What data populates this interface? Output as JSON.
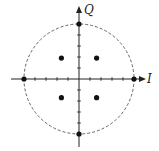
{
  "diagram": {
    "type": "constellation",
    "axes": {
      "x_label": "I",
      "y_label": "Q"
    },
    "center_px": [
      79,
      79
    ],
    "unit_px": 11,
    "ticks_per_side": 5,
    "circle_radius_units": 5,
    "points": [
      {
        "i": -5,
        "q": 0
      },
      {
        "i": 5,
        "q": 0
      },
      {
        "i": 0,
        "q": 5
      },
      {
        "i": 0,
        "q": -5
      },
      {
        "i": -1.6,
        "q": 1.9
      },
      {
        "i": 1.6,
        "q": 1.9
      },
      {
        "i": -1.6,
        "q": -1.7
      },
      {
        "i": 1.6,
        "q": -1.7
      }
    ],
    "colors": {
      "axis": "#222222",
      "circle": "#555555",
      "point": "#111111"
    }
  }
}
